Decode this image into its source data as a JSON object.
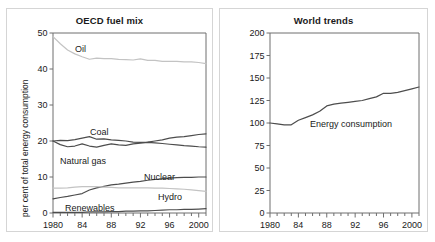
{
  "figure": {
    "background_color": "#ffffff",
    "panel_border_color": "#d5d5d5",
    "dark_line_color": "#4d4d4d",
    "light_line_color": "#c3c3c3",
    "axis_color": "#6e6e6e",
    "text_color": "#1a1a1a"
  },
  "panels": {
    "left": {
      "title": "OECD fuel mix",
      "ylabel": "per cent of total energy consumption",
      "y_ticks": [
        "0",
        "10",
        "20",
        "30",
        "40",
        "50"
      ],
      "x_ticks": [
        "1980",
        "84",
        "88",
        "92",
        "96",
        "2000"
      ],
      "series_labels": {
        "oil": "Oil",
        "coal": "Coal",
        "natural_gas": "Natural gas",
        "nuclear": "Nuclear",
        "hydro": "Hydro",
        "renewables": "Renewables"
      }
    },
    "right": {
      "title": "World trends",
      "ylabel": "Index: 1900 – 100",
      "y_ticks": [
        "0",
        "25",
        "50",
        "75",
        "100",
        "125",
        "150",
        "175",
        "200"
      ],
      "x_ticks": [
        "1980",
        "84",
        "88",
        "92",
        "96",
        "2000"
      ],
      "series_labels": {
        "energy_consumption": "Energy consumption"
      }
    }
  },
  "chart_data": [
    {
      "type": "line",
      "title": "OECD fuel mix",
      "xlabel": "",
      "ylabel": "per cent of total energy consumption",
      "xlim": [
        1980,
        2001
      ],
      "ylim": [
        0,
        50
      ],
      "yticks": [
        0,
        10,
        20,
        30,
        40,
        50
      ],
      "xticks": [
        1980,
        1984,
        1988,
        1992,
        1996,
        2000
      ],
      "xtick_labels": [
        "1980",
        "84",
        "88",
        "92",
        "96",
        "2000"
      ],
      "grid": false,
      "legend": "inline-labels",
      "x": [
        1980,
        1981,
        1982,
        1983,
        1984,
        1985,
        1986,
        1987,
        1988,
        1989,
        1990,
        1991,
        1992,
        1993,
        1994,
        1995,
        1996,
        1997,
        1998,
        1999,
        2000,
        2001
      ],
      "series": [
        {
          "name": "Oil",
          "color": "#c3c3c3",
          "values": [
            49.0,
            47.0,
            45.3,
            44.2,
            43.4,
            42.7,
            43.0,
            42.9,
            42.9,
            42.7,
            42.6,
            42.5,
            42.8,
            42.4,
            42.4,
            42.1,
            42.1,
            42.1,
            42.0,
            42.0,
            41.8,
            41.5
          ]
        },
        {
          "name": "Coal",
          "color": "#4d4d4d",
          "values": [
            20.0,
            20.2,
            20.1,
            20.4,
            20.8,
            21.2,
            20.5,
            20.6,
            20.3,
            20.2,
            20.0,
            19.7,
            19.6,
            19.7,
            20.0,
            20.3,
            20.8,
            21.1,
            21.2,
            21.5,
            21.8,
            22.0
          ]
        },
        {
          "name": "Natural gas",
          "color": "#4d4d4d",
          "values": [
            20.0,
            19.0,
            18.4,
            18.6,
            19.2,
            18.6,
            18.3,
            18.8,
            19.2,
            18.9,
            18.8,
            19.2,
            19.4,
            19.6,
            19.5,
            19.3,
            19.1,
            18.9,
            18.7,
            18.6,
            18.4,
            18.3
          ]
        },
        {
          "name": "Nuclear",
          "color": "#4d4d4d",
          "values": [
            3.9,
            4.3,
            4.6,
            5.0,
            5.4,
            6.4,
            7.0,
            7.4,
            7.8,
            8.0,
            8.3,
            8.6,
            8.8,
            9.1,
            9.3,
            9.5,
            9.7,
            9.8,
            9.9,
            9.9,
            10.0,
            10.0
          ]
        },
        {
          "name": "Hydro",
          "color": "#c3c3c3",
          "values": [
            6.9,
            6.9,
            7.0,
            7.2,
            7.3,
            7.3,
            7.3,
            7.2,
            7.1,
            7.0,
            7.0,
            7.0,
            7.0,
            7.0,
            6.9,
            6.9,
            6.8,
            6.7,
            6.6,
            6.4,
            6.2,
            6.0
          ]
        },
        {
          "name": "Renewables",
          "color": "#4d4d4d",
          "values": [
            0.2,
            0.2,
            0.2,
            0.2,
            0.2,
            0.3,
            0.3,
            0.3,
            0.4,
            0.4,
            0.5,
            0.5,
            0.6,
            0.6,
            0.7,
            0.8,
            0.9,
            0.9,
            1.0,
            1.0,
            1.1,
            1.2
          ]
        }
      ]
    },
    {
      "type": "line",
      "title": "World trends",
      "xlabel": "",
      "ylabel": "Index: 1900 – 100",
      "xlim": [
        1980,
        2001
      ],
      "ylim": [
        0,
        200
      ],
      "yticks": [
        0,
        25,
        50,
        75,
        100,
        125,
        150,
        175,
        200
      ],
      "xticks": [
        1980,
        1984,
        1988,
        1992,
        1996,
        2000
      ],
      "xtick_labels": [
        "1980",
        "84",
        "88",
        "92",
        "96",
        "2000"
      ],
      "grid": false,
      "legend": "inline-labels",
      "x": [
        1980,
        1981,
        1982,
        1983,
        1984,
        1985,
        1986,
        1987,
        1988,
        1989,
        1990,
        1991,
        1992,
        1993,
        1994,
        1995,
        1996,
        1997,
        1998,
        1999,
        2000,
        2001
      ],
      "series": [
        {
          "name": "Energy consumption",
          "color": "#4d4d4d",
          "values": [
            100,
            99,
            98,
            98,
            103,
            106,
            109,
            113,
            119,
            121,
            122,
            123,
            124,
            125,
            127,
            129,
            133,
            133,
            134,
            136,
            138,
            140
          ]
        }
      ]
    }
  ]
}
